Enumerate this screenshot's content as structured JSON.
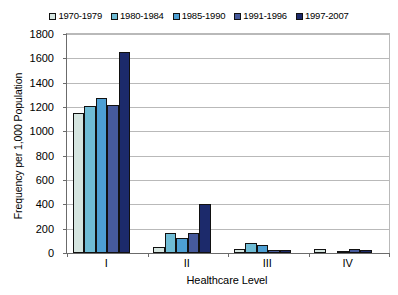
{
  "chart_data": {
    "type": "bar",
    "title": "",
    "xlabel": "Healthcare Level",
    "ylabel": "Frequency per 1,000 Population",
    "categories": [
      "I",
      "II",
      "III",
      "IV"
    ],
    "ylim": [
      0,
      1800
    ],
    "ytick_step": 200,
    "yticks": [
      0,
      200,
      400,
      600,
      800,
      1000,
      1200,
      1400,
      1600,
      1800
    ],
    "ytick_labels": [
      "0",
      "200",
      "400",
      "600",
      "800",
      "1000",
      "1200",
      "1400",
      "1600",
      "1800"
    ],
    "grid": true,
    "legend_position": "top-center",
    "series": [
      {
        "name": "1970-1979",
        "color": "#d5e5e0",
        "values": [
          1150,
          50,
          30,
          30
        ]
      },
      {
        "name": "1980-1984",
        "color": "#6fbcd5",
        "values": [
          1205,
          165,
          80,
          0
        ]
      },
      {
        "name": "1985-1990",
        "color": "#4d9fd3",
        "values": [
          1270,
          120,
          62,
          18
        ]
      },
      {
        "name": "1991-1996",
        "color": "#465a9c",
        "values": [
          1215,
          165,
          22,
          30
        ]
      },
      {
        "name": "1997-2007",
        "color": "#1c2a6b",
        "values": [
          1655,
          400,
          22,
          22
        ]
      }
    ]
  }
}
